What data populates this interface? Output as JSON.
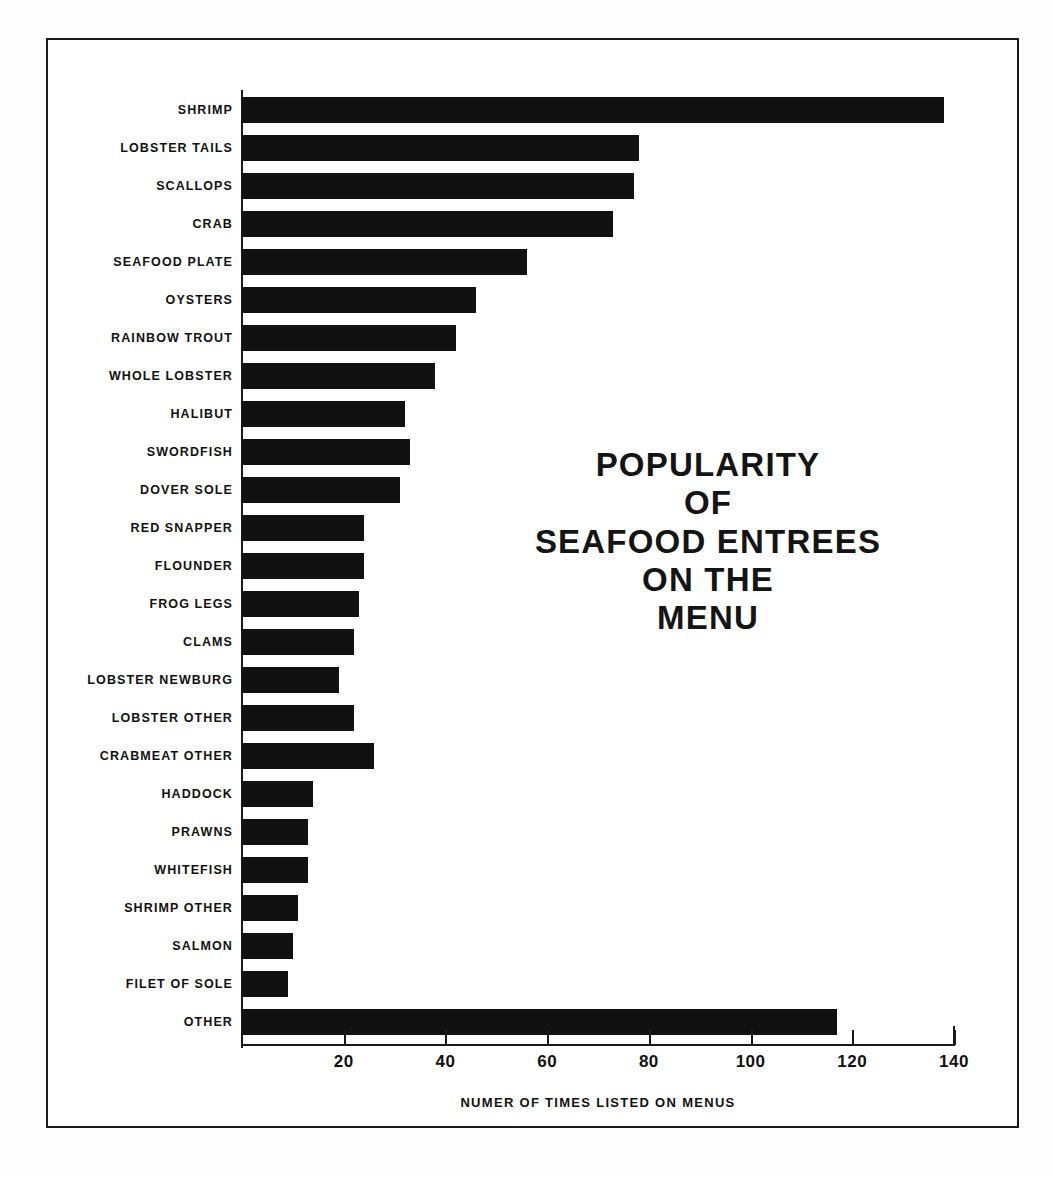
{
  "chart_data": {
    "type": "bar",
    "orientation": "horizontal",
    "title_lines": [
      "POPULARITY",
      "OF",
      "SEAFOOD ENTREES",
      "ON THE",
      "MENU"
    ],
    "xlabel": "NUMER OF TIMES LISTED ON MENUS",
    "ylabel": "",
    "xlim": [
      0,
      140
    ],
    "xticks": [
      20,
      40,
      60,
      80,
      100,
      120,
      140
    ],
    "xtick_labels": [
      "20",
      "40",
      "60",
      "80",
      "100",
      "120",
      "140"
    ],
    "grid": false,
    "legend": null,
    "bar_color": "#111111",
    "background_color": "#ffffff",
    "categories": [
      "SHRIMP",
      "LOBSTER TAILS",
      "SCALLOPS",
      "CRAB",
      "SEAFOOD PLATE",
      "OYSTERS",
      "RAINBOW TROUT",
      "WHOLE LOBSTER",
      "HALIBUT",
      "SWORDFISH",
      "DOVER SOLE",
      "RED SNAPPER",
      "FLOUNDER",
      "FROG LEGS",
      "CLAMS",
      "LOBSTER NEWBURG",
      "LOBSTER OTHER",
      "CRABMEAT OTHER",
      "HADDOCK",
      "PRAWNS",
      "WHITEFISH",
      "SHRIMP OTHER",
      "SALMON",
      "FILET OF SOLE",
      "OTHER"
    ],
    "values": [
      138,
      78,
      77,
      73,
      56,
      46,
      42,
      38,
      32,
      33,
      31,
      24,
      24,
      23,
      22,
      19,
      22,
      26,
      14,
      13,
      13,
      11,
      10,
      9,
      117
    ]
  }
}
